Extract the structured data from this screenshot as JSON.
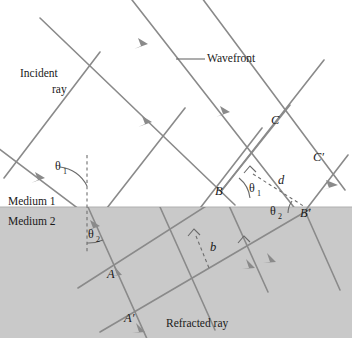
{
  "figure": {
    "colors": {
      "line": "#8a8a8a",
      "medium2_fill": "#c9c9c9",
      "medium1_fill": "#ffffff",
      "text": "#1a1a1a",
      "dashed": "#6e6e6e"
    }
  },
  "labels": {
    "wavefront": "Wavefront",
    "incident_ray_line1": "Incident",
    "incident_ray_line2": "ray",
    "refracted_ray": "Refracted ray",
    "medium1": "Medium 1",
    "medium2": "Medium 2",
    "theta": "θ",
    "theta1_sub": "1",
    "theta2_sub": "2",
    "point_A": "A",
    "point_A_prime": "A′",
    "point_B": "B",
    "point_B_prime": "B′",
    "point_C": "C",
    "point_C_prime": "C′",
    "distance_d": "d",
    "distance_b": "b"
  },
  "angles": {
    "theta1_label": "θ₁",
    "theta2_label": "θ₂",
    "theta1_occurrences": 2,
    "theta2_occurrences": 2
  },
  "geometry": {
    "boundary_y": 207,
    "medium2_bottom_y": 338,
    "medium2_left_x": 0,
    "medium2_right_x": 352,
    "incident_ray_angle_deg": 37,
    "refracted_ray_angle_deg": 66,
    "normal_x": 87,
    "normal_top_y": 155,
    "normal_bottom_y": 253,
    "incidence_point": [
      88,
      207
    ]
  },
  "points": {
    "A": [
      112,
      273
    ],
    "A_prime": [
      130,
      317
    ],
    "B": [
      222,
      190
    ],
    "B_prime": [
      305,
      211
    ],
    "C": [
      276,
      125
    ],
    "C_prime": [
      318,
      162
    ]
  }
}
